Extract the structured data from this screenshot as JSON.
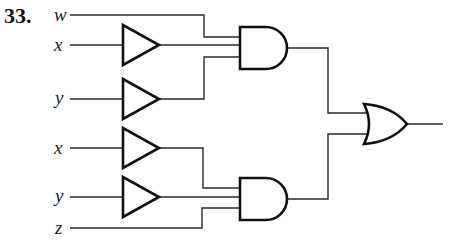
{
  "problem": {
    "number": "33."
  },
  "inputs": [
    {
      "label": "w",
      "y": 15
    },
    {
      "label": "x",
      "y": 45
    },
    {
      "label": "y",
      "y": 99
    },
    {
      "label": "x",
      "y": 148
    },
    {
      "label": "y",
      "y": 197
    },
    {
      "label": "z",
      "y": 228
    }
  ],
  "gates": {
    "buffers": [
      {
        "id": "buf1",
        "input": "x",
        "center_y": 45
      },
      {
        "id": "buf2",
        "input": "y",
        "center_y": 99
      },
      {
        "id": "buf3",
        "input": "x",
        "center_y": 148
      },
      {
        "id": "buf4",
        "input": "y",
        "center_y": 197
      }
    ],
    "and_gates": [
      {
        "id": "and1",
        "inputs": [
          "w",
          "buf1",
          "buf2"
        ]
      },
      {
        "id": "and2",
        "inputs": [
          "buf3",
          "buf4",
          "z"
        ]
      }
    ],
    "or_gates": [
      {
        "id": "or1",
        "inputs": [
          "and1",
          "and2"
        ]
      }
    ]
  }
}
